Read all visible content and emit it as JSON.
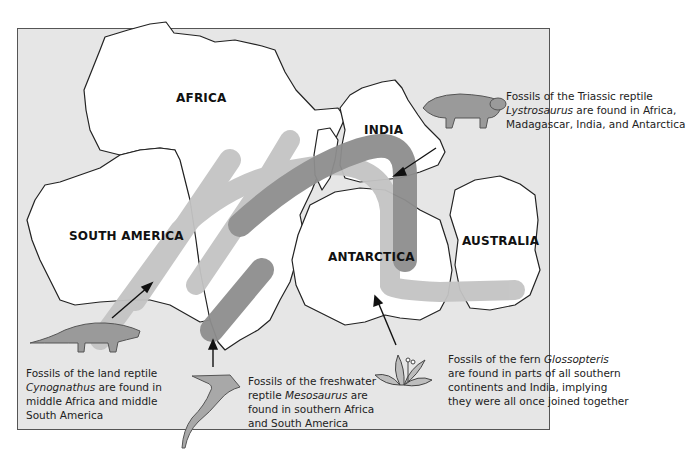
{
  "continents": {
    "africa": "AFRICA",
    "south_america": "SOUTH AMERICA",
    "india": "INDIA",
    "antarctica": "ANTARCTICA",
    "australia": "AUSTRALIA"
  },
  "captions": {
    "lystrosaurus": {
      "line1": "Fossils of the Triassic reptile",
      "line2_italic": "Lystrosaurus",
      "line2_rest": " are found in Africa,",
      "line3": "Madagascar, India, and Antarctica"
    },
    "cynognathus": {
      "line1": "Fossils of the land reptile",
      "line2_italic": "Cynognathus",
      "line2_rest": " are found in",
      "line3": "middle Africa and middle",
      "line4": "South America"
    },
    "mesosaurus": {
      "line1": "Fossils of the freshwater",
      "line2_pre": "reptile ",
      "line2_italic": "Mesosaurus",
      "line2_rest": " are",
      "line3": "found in southern Africa",
      "line4": "and South America"
    },
    "glossopteris": {
      "line1_pre": "Fossils of the fern ",
      "line1_italic": "Glossopteris",
      "line2": "are found in parts of all southern",
      "line3": "continents and India, implying",
      "line4": "they were all once joined together"
    }
  },
  "colors": {
    "ocean": "#e6e6e6",
    "land": "#ffffff",
    "band_light": "#c4c4c4",
    "band_dark": "#8e8e8e",
    "reptile": "#9a9a9a"
  }
}
